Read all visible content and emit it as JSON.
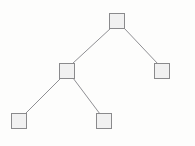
{
  "figure": {
    "background_color": "#fdfdfc",
    "width": 195,
    "height": 146
  },
  "style": {
    "node_fill": "#f1f1f1",
    "node_stroke": "#8a8a8c",
    "node_stroke_width": 1.2,
    "node_size": 15,
    "edge_stroke": "#8f8f93",
    "edge_stroke_width": 1
  },
  "chart_data": {
    "type": "diagram",
    "subtype": "tree",
    "title": "",
    "xlabel": "",
    "ylabel": "",
    "grid": false,
    "legend": false,
    "node_shape": "square",
    "node_count": 5,
    "edge_count": 4,
    "depth": 3,
    "nodes": [
      {
        "id": "root",
        "label": "",
        "x": 117,
        "y": 21,
        "w": 15,
        "h": 15,
        "level": 0,
        "role": "root"
      },
      {
        "id": "internal-l",
        "label": "",
        "x": 67,
        "y": 71,
        "w": 15,
        "h": 15,
        "level": 1,
        "role": "internal"
      },
      {
        "id": "leaf-r",
        "label": "",
        "x": 162,
        "y": 71,
        "w": 15,
        "h": 15,
        "level": 1,
        "role": "leaf"
      },
      {
        "id": "leaf-ll",
        "label": "",
        "x": 19,
        "y": 121,
        "w": 15,
        "h": 15,
        "level": 2,
        "role": "leaf"
      },
      {
        "id": "leaf-lr",
        "label": "",
        "x": 104,
        "y": 121,
        "w": 15,
        "h": 15,
        "level": 2,
        "role": "leaf"
      }
    ],
    "edges": [
      {
        "id": "edge-root-internal-l",
        "from": "root",
        "to": "internal-l",
        "x1": 111,
        "y1": 28,
        "x2": 72,
        "y2": 64
      },
      {
        "id": "edge-root-leaf-r",
        "from": "root",
        "to": "leaf-r",
        "x1": 124,
        "y1": 28,
        "x2": 158,
        "y2": 64
      },
      {
        "id": "edge-internal-leaf-ll",
        "from": "internal-l",
        "to": "leaf-ll",
        "x1": 61,
        "y1": 78,
        "x2": 25,
        "y2": 114
      },
      {
        "id": "edge-internal-leaf-lr",
        "from": "internal-l",
        "to": "leaf-lr",
        "x1": 73,
        "y1": 78,
        "x2": 100,
        "y2": 114
      }
    ]
  }
}
